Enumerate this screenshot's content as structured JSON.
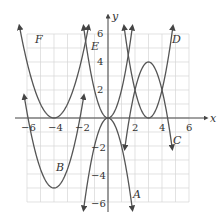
{
  "chart_data": {
    "type": "line",
    "title": "",
    "xlabel": "x",
    "ylabel": "y",
    "xlim": [
      -6,
      6
    ],
    "ylim": [
      -6,
      6
    ],
    "grid": true,
    "x_ticks": [
      "-6",
      "-4",
      "-2",
      "2",
      "4",
      "6"
    ],
    "y_ticks": [
      "6",
      "4",
      "2",
      "-2",
      "-4",
      "-6"
    ],
    "series": [
      {
        "name": "A",
        "description": "downward parabola, vertex (0,0)",
        "equation": "y=-2x^2",
        "x_range": [
          -1.8,
          1.8
        ]
      },
      {
        "name": "B",
        "description": "upward parabola, vertex (-4,-5)",
        "equation": "y=1.35(x+4)^2-5",
        "x_range": [
          -6.2,
          -1.8
        ]
      },
      {
        "name": "C",
        "description": "downward parabola, vertex (3,4)",
        "equation": "y=-2(x-3)^2+4",
        "x_range": [
          1.25,
          4.75
        ]
      },
      {
        "name": "D",
        "description": "upward parabola, vertex (3,0)",
        "equation": "y=2(x-3)^2",
        "x_range": [
          1.2,
          4.8
        ]
      },
      {
        "name": "E",
        "description": "upward parabola, vertex (0,0)",
        "equation": "y=2x^2",
        "x_range": [
          -1.8,
          1.8
        ]
      },
      {
        "name": "F",
        "description": "upward parabola, vertex (-4,0)",
        "equation": "y=(x+4)^2",
        "x_range": [
          -6.55,
          -1.45
        ]
      }
    ]
  },
  "labels": {
    "x_axis": "x",
    "y_axis": "y",
    "A": "A",
    "B": "B",
    "C": "C",
    "D": "D",
    "E": "E",
    "F": "F",
    "ticks": {
      "xm6": "−6",
      "xm4": "−4",
      "xm2": "−2",
      "x2": "2",
      "x4": "4",
      "x6": "6",
      "y6": "6",
      "y4": "4",
      "y2": "2",
      "ym2": "−2",
      "ym4": "−4",
      "ym6": "−6"
    }
  }
}
